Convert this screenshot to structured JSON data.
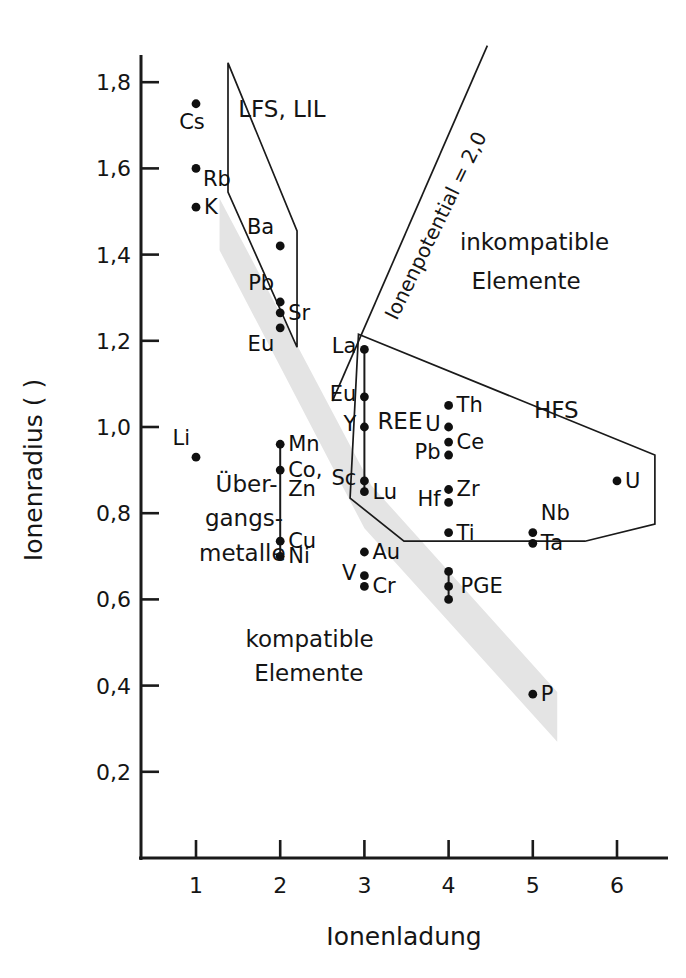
{
  "chart_data": {
    "type": "scatter",
    "title": "",
    "xlabel": "Ionenladung",
    "ylabel": "Ionenradius ( )",
    "xlim": [
      0.35,
      6.55
    ],
    "ylim": [
      0.0,
      1.9
    ],
    "xticks": [
      "1",
      "2",
      "3",
      "4",
      "5",
      "6"
    ],
    "xtick_values": [
      1,
      2,
      3,
      4,
      5,
      6
    ],
    "yticks": [
      "0,2",
      "0,4",
      "0,6",
      "0,8",
      "1,0",
      "1,2",
      "1,4",
      "1,6",
      "1,8"
    ],
    "ytick_values": [
      0.2,
      0.4,
      0.6,
      0.8,
      1.0,
      1.2,
      1.4,
      1.6,
      1.8
    ],
    "grid": false,
    "legend": "none",
    "points": [
      {
        "label": "Cs",
        "x": 1,
        "y": 1.75,
        "label_pos": "below"
      },
      {
        "label": "Rb",
        "x": 1,
        "y": 1.6,
        "label_pos": "right-below"
      },
      {
        "label": "K",
        "x": 1,
        "y": 1.51,
        "label_pos": "right"
      },
      {
        "label": "Ba",
        "x": 2,
        "y": 1.42,
        "label_pos": "left-above"
      },
      {
        "label": "Pb",
        "x": 2,
        "y": 1.29,
        "label_pos": "left-above"
      },
      {
        "label": "Sr",
        "x": 2,
        "y": 1.265,
        "label_pos": "right"
      },
      {
        "label": "Eu",
        "x": 2,
        "y": 1.23,
        "label_pos": "left-below"
      },
      {
        "label": "Li",
        "x": 1,
        "y": 0.93,
        "label_pos": "left-above"
      },
      {
        "label": "Mn",
        "x": 2,
        "y": 0.96,
        "label_pos": "right"
      },
      {
        "label": "Co,",
        "x": 2,
        "y": 0.9,
        "label_pos": "right"
      },
      {
        "label": "Zn",
        "x": 2,
        "y": 0.855,
        "label_pos": "text-only"
      },
      {
        "label": "Cu",
        "x": 2,
        "y": 0.735,
        "label_pos": "right"
      },
      {
        "label": "Ni",
        "x": 2,
        "y": 0.7,
        "label_pos": "right"
      },
      {
        "label": "La",
        "x": 3,
        "y": 1.18,
        "label_pos": "left"
      },
      {
        "label": "Eu",
        "x": 3,
        "y": 1.07,
        "label_pos": "left"
      },
      {
        "label": "Y",
        "x": 3,
        "y": 1.0,
        "label_pos": "left"
      },
      {
        "label": "Sc",
        "x": 3,
        "y": 0.875,
        "label_pos": "left"
      },
      {
        "label": "Lu",
        "x": 3,
        "y": 0.85,
        "label_pos": "right"
      },
      {
        "label": "Au",
        "x": 3,
        "y": 0.71,
        "label_pos": "right"
      },
      {
        "label": "V",
        "x": 3,
        "y": 0.655,
        "label_pos": "left"
      },
      {
        "label": "Cr",
        "x": 3,
        "y": 0.63,
        "label_pos": "right"
      },
      {
        "label": "Th",
        "x": 4,
        "y": 1.05,
        "label_pos": "right"
      },
      {
        "label": "U",
        "x": 4,
        "y": 1.0,
        "label_pos": "left"
      },
      {
        "label": "Ce",
        "x": 4,
        "y": 0.965,
        "label_pos": "right"
      },
      {
        "label": "Pb",
        "x": 4,
        "y": 0.935,
        "label_pos": "left"
      },
      {
        "label": "Zr",
        "x": 4,
        "y": 0.855,
        "label_pos": "right"
      },
      {
        "label": "Hf",
        "x": 4,
        "y": 0.825,
        "label_pos": "left"
      },
      {
        "label": "Ti",
        "x": 4,
        "y": 0.755,
        "label_pos": "right"
      },
      {
        "label": "PGE",
        "x": 4,
        "y": 0.63,
        "label_pos": "right-pair"
      },
      {
        "label": "Nb",
        "x": 5,
        "y": 0.755,
        "label_pos": "right-above"
      },
      {
        "label": "Ta",
        "x": 5,
        "y": 0.73,
        "label_pos": "right"
      },
      {
        "label": "P",
        "x": 5,
        "y": 0.38,
        "label_pos": "right"
      },
      {
        "label": "U",
        "x": 6,
        "y": 0.875,
        "label_pos": "right"
      }
    ],
    "groups": [
      {
        "name": "REE",
        "x": 3,
        "y_from": 1.18,
        "y_to": 0.85,
        "label": "REE"
      },
      {
        "name": "transition-metals",
        "x": 2,
        "y_from": 0.96,
        "y_to": 0.7,
        "label": ""
      },
      {
        "name": "PGE",
        "x": 4,
        "y_from": 0.665,
        "y_to": 0.6,
        "label": "PGE"
      }
    ],
    "annotations": [
      {
        "id": "lfs-lil",
        "text": "LFS, LIL",
        "x": 2.02,
        "y": 1.735
      },
      {
        "id": "hfs",
        "text": "HFS",
        "x": 5.28,
        "y": 1.035
      },
      {
        "id": "inkompatible-1",
        "text": "inkompatible",
        "x": 5.02,
        "y": 1.425
      },
      {
        "id": "inkompatible-2",
        "text": "Elemente",
        "x": 4.92,
        "y": 1.335
      },
      {
        "id": "kompatible-1",
        "text": "kompatible",
        "x": 2.35,
        "y": 0.505
      },
      {
        "id": "kompatible-2",
        "text": "Elemente",
        "x": 2.34,
        "y": 0.425
      },
      {
        "id": "uebergangsmetalle-1",
        "text": "Über-",
        "x": 1.6,
        "y": 0.865
      },
      {
        "id": "uebergangsmetalle-2",
        "text": "gangs-",
        "x": 1.57,
        "y": 0.785
      },
      {
        "id": "uebergangsmetalle-3",
        "text": "metalle",
        "x": 1.55,
        "y": 0.705
      },
      {
        "id": "ionenpotential",
        "text": "Ionenpotential = 2,0",
        "x": 3.92,
        "y": 1.46
      }
    ],
    "polygons": [
      {
        "id": "lfs-lil-field",
        "points": [
          [
            1.38,
            1.845
          ],
          [
            2.2,
            1.455
          ],
          [
            2.2,
            1.185
          ],
          [
            1.38,
            1.545
          ]
        ]
      },
      {
        "id": "hfs-field",
        "points": [
          [
            2.93,
            1.215
          ],
          [
            6.45,
            0.935
          ],
          [
            6.45,
            0.775
          ],
          [
            5.62,
            0.735
          ],
          [
            3.47,
            0.735
          ],
          [
            2.83,
            0.835
          ]
        ]
      }
    ],
    "lines": [
      {
        "id": "ionenpotential-line",
        "x1": 2.62,
        "y1": 1.06,
        "x2": 4.46,
        "y2": 1.885
      }
    ],
    "band": {
      "id": "mantle-melt-band",
      "description": "diagonal grey band",
      "color": "#e4e4e4",
      "points": [
        [
          1.28,
          1.53
        ],
        [
          3.08,
          0.865
        ],
        [
          5.29,
          0.385
        ],
        [
          5.29,
          0.27
        ],
        [
          3.0,
          0.765
        ],
        [
          1.28,
          1.41
        ]
      ]
    }
  },
  "axes": {
    "y_title": "Ionenradius ( )",
    "x_title": "Ionenladung"
  }
}
